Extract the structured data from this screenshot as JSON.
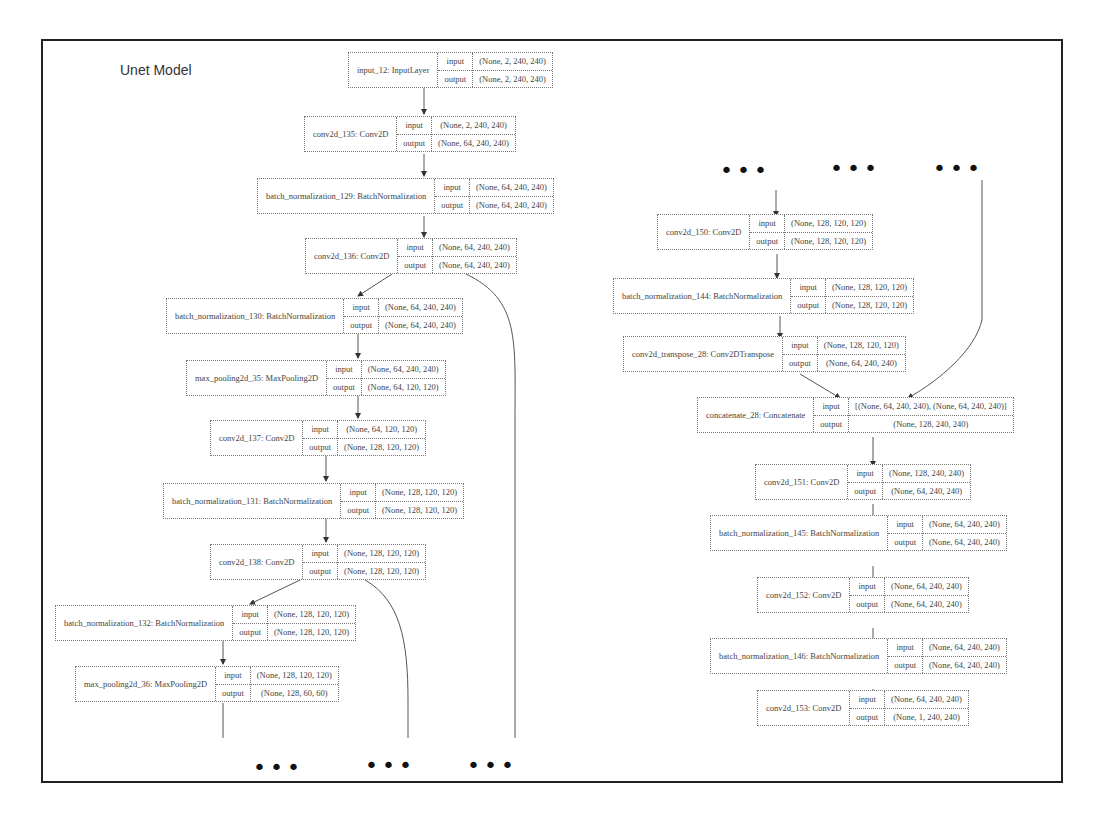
{
  "title": "Unet Model",
  "labels": {
    "input": "input",
    "output": "output"
  },
  "ellipsis": "•••",
  "left_column": [
    {
      "name": "input_12: InputLayer",
      "input": "(None, 2, 240, 240)",
      "output": "(None, 2, 240, 240)"
    },
    {
      "name": "conv2d_135: Conv2D",
      "input": "(None, 2, 240, 240)",
      "output": "(None, 64, 240, 240)"
    },
    {
      "name": "batch_normalization_129: BatchNormalization",
      "input": "(None, 64, 240, 240)",
      "output": "(None, 64, 240, 240)"
    },
    {
      "name": "conv2d_136: Conv2D",
      "input": "(None, 64, 240, 240)",
      "output": "(None, 64, 240, 240)"
    },
    {
      "name": "batch_normalization_130: BatchNormalization",
      "input": "(None, 64, 240, 240)",
      "output": "(None, 64, 240, 240)"
    },
    {
      "name": "max_pooling2d_35: MaxPooling2D",
      "input": "(None, 64, 240, 240)",
      "output": "(None, 64, 120, 120)"
    },
    {
      "name": "conv2d_137: Conv2D",
      "input": "(None, 64, 120, 120)",
      "output": "(None, 128, 120, 120)"
    },
    {
      "name": "batch_normalization_131: BatchNormalization",
      "input": "(None, 128, 120, 120)",
      "output": "(None, 128, 120, 120)"
    },
    {
      "name": "conv2d_138: Conv2D",
      "input": "(None, 128, 120, 120)",
      "output": "(None, 128, 120, 120)"
    },
    {
      "name": "batch_normalization_132: BatchNormalization",
      "input": "(None, 128, 120, 120)",
      "output": "(None, 128, 120, 120)"
    },
    {
      "name": "max_pooling2d_36: MaxPooling2D",
      "input": "(None, 128, 120, 120)",
      "output": "(None, 128, 60, 60)"
    }
  ],
  "right_column": [
    {
      "name": "conv2d_150: Conv2D",
      "input": "(None, 128, 120, 120)",
      "output": "(None, 128, 120, 120)"
    },
    {
      "name": "batch_normalization_144: BatchNormalization",
      "input": "(None, 128, 120, 120)",
      "output": "(None, 128, 120, 120)"
    },
    {
      "name": "conv2d_transpose_28: Conv2DTranspose",
      "input": "(None, 128, 120, 120)",
      "output": "(None, 64, 240, 240)"
    },
    {
      "name": "concatenate_28: Concatenate",
      "input": "[(None, 64, 240, 240), (None, 64, 240, 240)]",
      "output": "(None, 128, 240, 240)"
    },
    {
      "name": "conv2d_151: Conv2D",
      "input": "(None, 128, 240, 240)",
      "output": "(None, 64, 240, 240)"
    },
    {
      "name": "batch_normalization_145: BatchNormalization",
      "input": "(None, 64, 240, 240)",
      "output": "(None, 64, 240, 240)"
    },
    {
      "name": "conv2d_152: Conv2D",
      "input": "(None, 64, 240, 240)",
      "output": "(None, 64, 240, 240)"
    },
    {
      "name": "batch_normalization_146: BatchNormalization",
      "input": "(None, 64, 240, 240)",
      "output": "(None, 64, 240, 240)"
    },
    {
      "name": "conv2d_153: Conv2D",
      "input": "(None, 64, 240, 240)",
      "output": "(None, 1, 240, 240)"
    }
  ]
}
